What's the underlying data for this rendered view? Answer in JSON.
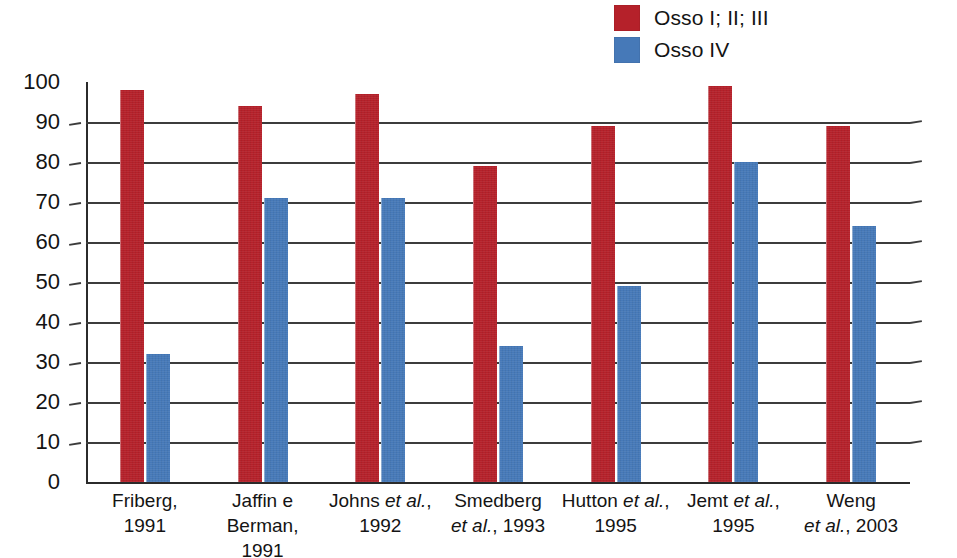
{
  "legend": {
    "position": "top-right",
    "items": [
      {
        "label": "Osso I; II; III",
        "color": "#b5212a",
        "swatch_name": "legend-swatch-osso-i-ii-iii"
      },
      {
        "label": "Osso IV",
        "color": "#4679b8",
        "swatch_name": "legend-swatch-osso-iv"
      }
    ]
  },
  "chart_data": {
    "type": "bar",
    "title": "",
    "subtitle": "",
    "xlabel": "",
    "ylabel": "",
    "ylim": [
      0,
      100
    ],
    "ytick_step": 10,
    "grid": true,
    "legend_position": "top-right",
    "categories": [
      "Friberg, 1991",
      "Jaffin e Berman, 1991",
      "Johns et al., 1992",
      "Smedberg et al., 1993",
      "Hutton et al., 1995",
      "Jemt et al., 1995",
      "Weng et al., 2003"
    ],
    "category_lines": [
      [
        "Friberg,",
        "1991"
      ],
      [
        "Jaffin e",
        "Berman, 1991"
      ],
      [
        "Johns |et al.|,",
        "1992"
      ],
      [
        "Smedberg",
        "|et al.|, 1993"
      ],
      [
        "Hutton |et al.|,",
        "1995"
      ],
      [
        "Jemt |et al.|,",
        "1995"
      ],
      [
        "Weng",
        "|et al.|, 2003"
      ]
    ],
    "ytick_labels": [
      "0",
      "10",
      "20",
      "30",
      "40",
      "50",
      "60",
      "70",
      "80",
      "90",
      "100"
    ],
    "series": [
      {
        "name": "Osso I; II; III",
        "color": "#b5212a",
        "values": [
          98,
          94,
          97,
          79,
          89,
          99,
          89
        ]
      },
      {
        "name": "Osso IV",
        "color": "#4679b8",
        "values": [
          32,
          71,
          71,
          34,
          49,
          80,
          64
        ]
      }
    ]
  }
}
